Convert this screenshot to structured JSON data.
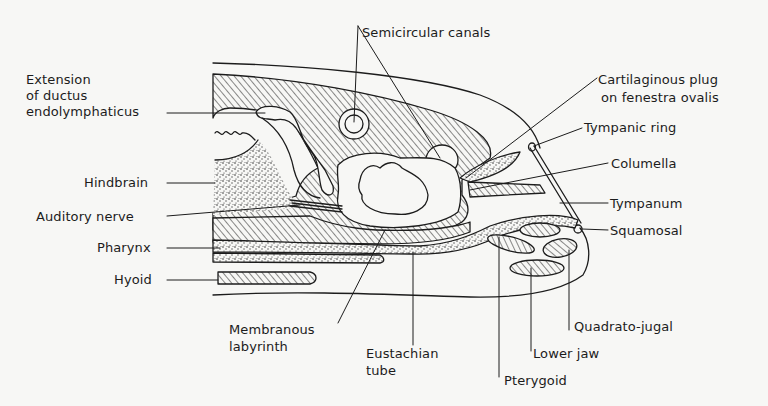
{
  "diagram": {
    "type": "anatomical-cross-section",
    "colors": {
      "ink": "#1c1c1c",
      "paper": "#f7f7f5"
    },
    "labels": {
      "semicircular_canals": "Semicircular canals",
      "extension_line1": "Extension",
      "extension_line2": "of ductus",
      "extension_line3": "endolymphaticus",
      "hindbrain": "Hindbrain",
      "auditory_nerve": "Auditory nerve",
      "pharynx": "Pharynx",
      "hyoid": "Hyoid",
      "membranous_line1": "Membranous",
      "membranous_line2": "labyrinth",
      "eustachian_line1": "Eustachian",
      "eustachian_line2": "tube",
      "pterygoid": "Pterygoid",
      "lower_jaw": "Lower jaw",
      "quadrato_jugal": "Quadrato-jugal",
      "squamosal": "Squamosal",
      "tympanum": "Tympanum",
      "columella": "Columella",
      "tympanic_ring": "Tympanic ring",
      "cartilaginous_line1": "Cartilaginous plug",
      "cartilaginous_line2": "on fenestra ovalis"
    }
  }
}
